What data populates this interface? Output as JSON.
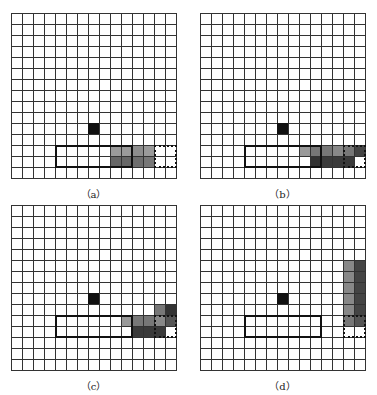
{
  "cell_size": 11,
  "grid": {
    "cols": 15,
    "rows": 15
  },
  "panels": [
    {
      "id": "a",
      "caption": "（a）",
      "origin": [
        11,
        13
      ],
      "obstacle": [
        7,
        10
      ],
      "solid_rect": {
        "col": 4,
        "row": 12,
        "w": 7,
        "h": 2
      },
      "dotted_rect": {
        "col": 13,
        "row": 12,
        "w": 2,
        "h": 2
      },
      "shaded": [
        {
          "c": 9,
          "r": 12,
          "v": "#9a9a9a"
        },
        {
          "c": 10,
          "r": 12,
          "v": "#9a9a9a"
        },
        {
          "c": 11,
          "r": 12,
          "v": "#8d8d8d"
        },
        {
          "c": 12,
          "r": 12,
          "v": "#9a9a9a"
        },
        {
          "c": 9,
          "r": 13,
          "v": "#666"
        },
        {
          "c": 10,
          "r": 13,
          "v": "#666"
        },
        {
          "c": 11,
          "r": 13,
          "v": "#6e6e6e"
        },
        {
          "c": 12,
          "r": 13,
          "v": "#777"
        }
      ]
    },
    {
      "id": "b",
      "caption": "（b）",
      "origin": [
        200,
        13
      ],
      "obstacle": [
        7,
        10
      ],
      "solid_rect": {
        "col": 4,
        "row": 12,
        "w": 7,
        "h": 2
      },
      "dotted_rect": {
        "col": 13,
        "row": 12,
        "w": 2,
        "h": 2
      },
      "shaded": [
        {
          "c": 9,
          "r": 12,
          "v": "#9a9a9a"
        },
        {
          "c": 10,
          "r": 12,
          "v": "#777"
        },
        {
          "c": 11,
          "r": 12,
          "v": "#777"
        },
        {
          "c": 12,
          "r": 12,
          "v": "#888"
        },
        {
          "c": 13,
          "r": 12,
          "v": "#777"
        },
        {
          "c": 14,
          "r": 12,
          "v": "#444"
        },
        {
          "c": 10,
          "r": 13,
          "v": "#333"
        },
        {
          "c": 11,
          "r": 13,
          "v": "#3a3a3a"
        },
        {
          "c": 12,
          "r": 13,
          "v": "#3a3a3a"
        },
        {
          "c": 13,
          "r": 13,
          "v": "#3a3a3a"
        }
      ]
    },
    {
      "id": "c",
      "caption": "（c）",
      "origin": [
        11,
        205
      ],
      "obstacle": [
        7,
        8
      ],
      "solid_rect": {
        "col": 4,
        "row": 10,
        "w": 7,
        "h": 2
      },
      "dotted_rect": {
        "col": 13,
        "row": 10,
        "w": 2,
        "h": 2
      },
      "shaded": [
        {
          "c": 13,
          "r": 9,
          "v": "#777"
        },
        {
          "c": 14,
          "r": 9,
          "v": "#333"
        },
        {
          "c": 10,
          "r": 10,
          "v": "#999"
        },
        {
          "c": 11,
          "r": 10,
          "v": "#777"
        },
        {
          "c": 12,
          "r": 10,
          "v": "#777"
        },
        {
          "c": 13,
          "r": 10,
          "v": "#888"
        },
        {
          "c": 14,
          "r": 10,
          "v": "#555"
        },
        {
          "c": 11,
          "r": 11,
          "v": "#3a3a3a"
        },
        {
          "c": 12,
          "r": 11,
          "v": "#3a3a3a"
        },
        {
          "c": 13,
          "r": 11,
          "v": "#3a3a3a"
        }
      ]
    },
    {
      "id": "d",
      "caption": "（d）",
      "origin": [
        200,
        205
      ],
      "obstacle": [
        7,
        8
      ],
      "solid_rect": {
        "col": 4,
        "row": 10,
        "w": 7,
        "h": 2
      },
      "dotted_rect": {
        "col": 13,
        "row": 10,
        "w": 2,
        "h": 2
      },
      "shaded": [
        {
          "c": 13,
          "r": 5,
          "v": "#888"
        },
        {
          "c": 14,
          "r": 5,
          "v": "#444"
        },
        {
          "c": 13,
          "r": 6,
          "v": "#888"
        },
        {
          "c": 14,
          "r": 6,
          "v": "#444"
        },
        {
          "c": 13,
          "r": 7,
          "v": "#888"
        },
        {
          "c": 14,
          "r": 7,
          "v": "#444"
        },
        {
          "c": 13,
          "r": 8,
          "v": "#888"
        },
        {
          "c": 14,
          "r": 8,
          "v": "#444"
        },
        {
          "c": 13,
          "r": 9,
          "v": "#888"
        },
        {
          "c": 14,
          "r": 9,
          "v": "#444"
        },
        {
          "c": 13,
          "r": 10,
          "v": "#777"
        },
        {
          "c": 14,
          "r": 10,
          "v": "#555"
        }
      ]
    }
  ]
}
